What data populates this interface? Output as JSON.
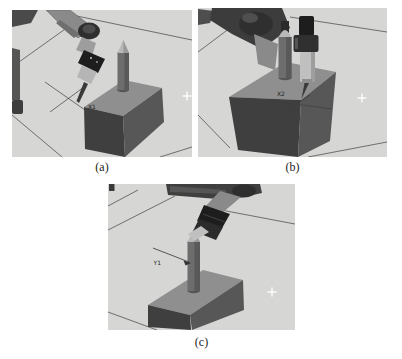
{
  "figure": {
    "panels": [
      {
        "caption": "(a)",
        "point_label": "X1",
        "description": "robot probe touching cube left corner"
      },
      {
        "caption": "(b)",
        "point_label": "X2",
        "description": "robot probe touching cube front-right corner"
      },
      {
        "caption": "(c)",
        "point_label": "Y1",
        "description": "robot probe touching peg on cube top"
      }
    ],
    "colors": {
      "floor": "#d6d6d5",
      "cube_top": "#8f8f8f",
      "cube_front": "#3f3f3f",
      "cube_side": "#575757",
      "peg_body": "#6d6d6d",
      "peg_tip": "#b9b9b9",
      "robot_dark": "#2f2f2f",
      "robot_mid": "#8a8a8a",
      "tool_black": "#1d1d1d",
      "tool_light": "#c0c0c0",
      "grid_line": "#3d3d3d",
      "label_text": "#1f1f1f",
      "marker_white": "#ffffff"
    }
  }
}
